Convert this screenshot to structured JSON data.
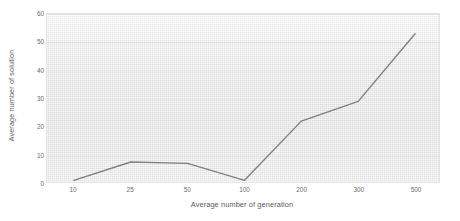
{
  "chart_data": {
    "type": "line",
    "title": "",
    "subtitle": "",
    "xlabel": "Average number of generation",
    "ylabel": "Average number of solution",
    "categories": [
      "10",
      "25",
      "50",
      "100",
      "200",
      "300",
      "500"
    ],
    "values": [
      1,
      7.5,
      7,
      1,
      22,
      29,
      53
    ],
    "series": [
      {
        "name": "Average number of solution",
        "values": [
          1,
          7.5,
          7,
          1,
          22,
          29,
          53
        ],
        "color": "#808080"
      }
    ],
    "yticks": [
      0,
      10,
      20,
      30,
      40,
      50,
      60
    ],
    "ylim": [
      0,
      60
    ],
    "xticklabels": [
      "10",
      "25",
      "50",
      "100",
      "200",
      "300",
      "500"
    ],
    "grid": "horizontal",
    "legend": "none",
    "markers": "none",
    "line_color": "#808080",
    "line_width": 1.4,
    "plot_background": "#e6e6e6",
    "border_color": "#e3e3e3",
    "tick_label_color": "#6a6a6a",
    "axis_title_color": "#5a5a5a",
    "annotations": []
  }
}
